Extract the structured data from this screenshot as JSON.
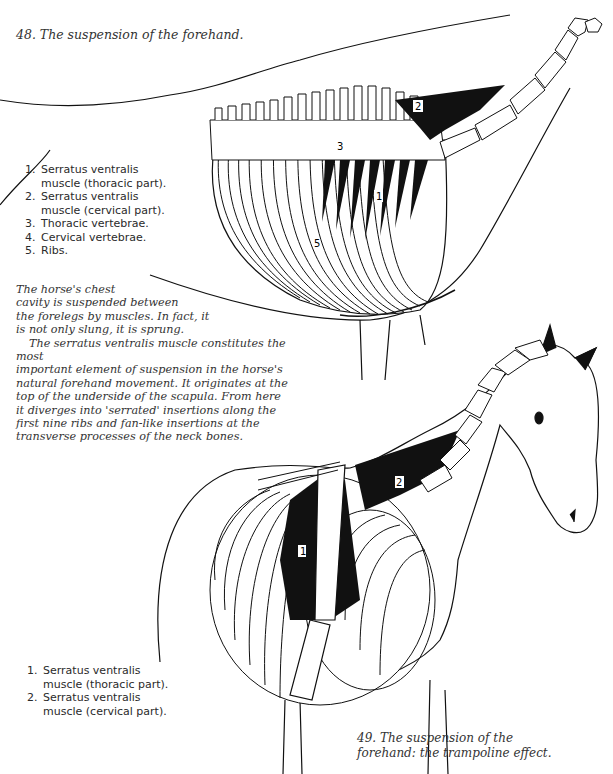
{
  "figures": [
    {
      "caption": "48.  The suspension of the forehand.",
      "legend": [
        {
          "num": "1.",
          "lines": [
            "Serratus ventralis",
            "muscle (thoracic part)."
          ]
        },
        {
          "num": "2.",
          "lines": [
            "Serratus ventralis",
            "muscle (cervical part)."
          ]
        },
        {
          "num": "3.",
          "lines": [
            "Thoracic vertebrae."
          ]
        },
        {
          "num": "4.",
          "lines": [
            "Cervical vertebrae."
          ]
        },
        {
          "num": "5.",
          "lines": [
            "Ribs."
          ]
        }
      ],
      "diagram_labels": [
        "1",
        "2",
        "3",
        "4",
        "5"
      ]
    },
    {
      "caption_lines": [
        "49.  The suspension of the",
        "forehand: the trampoline effect."
      ],
      "legend": [
        {
          "num": "1.",
          "lines": [
            "Serratus ventralis",
            "muscle (thoracic part)."
          ]
        },
        {
          "num": "2.",
          "lines": [
            "Serratus ventralis",
            "muscle (cervical part)."
          ]
        }
      ],
      "diagram_labels": [
        "1",
        "2"
      ]
    }
  ],
  "body": {
    "paragraph1_lines": [
      "The horse's chest",
      "cavity is suspended between",
      "the forelegs by muscles. In fact, it",
      "is not only slung, it is sprung."
    ],
    "paragraph2_lines": [
      "The serratus ventralis muscle constitutes the most",
      "important element of suspension in the horse's",
      "natural forehand movement. It originates at the",
      "top of the underside of the scapula. From here",
      "it diverges into 'serrated' insertions along the",
      "first nine ribs and fan-like insertions at the",
      "transverse processes of the neck bones."
    ]
  }
}
